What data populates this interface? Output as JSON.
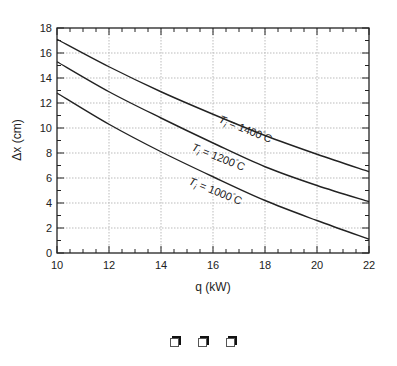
{
  "chart_data": {
    "type": "line",
    "title": "",
    "xlabel": "q (kW)",
    "ylabel": "Δx (cm)",
    "xlim": [
      10,
      22
    ],
    "ylim": [
      0,
      18
    ],
    "xticks": [
      10,
      12,
      14,
      16,
      18,
      20,
      22
    ],
    "yticks": [
      0,
      2,
      4,
      6,
      8,
      10,
      12,
      14,
      16,
      18
    ],
    "grid": true,
    "legend": "inline curve labels",
    "x": [
      10,
      12,
      14,
      16,
      18,
      20,
      22
    ],
    "series": [
      {
        "name": "Ti = 1400°C",
        "label_main": "T",
        "label_sub": "i",
        "label_rest": " = 1400",
        "label_unit": "C",
        "values": [
          17.1,
          14.9,
          12.9,
          11.1,
          9.4,
          7.9,
          6.5
        ]
      },
      {
        "name": "Ti = 1200°C",
        "label_main": "T",
        "label_sub": "i",
        "label_rest": " = 1200",
        "label_unit": "C",
        "values": [
          15.3,
          12.9,
          10.8,
          8.8,
          6.9,
          5.4,
          4.1
        ]
      },
      {
        "name": "Ti = 1000°C",
        "label_main": "T",
        "label_sub": "i",
        "label_rest": " = 1000",
        "label_unit": "C",
        "values": [
          12.8,
          10.3,
          8.1,
          6.1,
          4.2,
          2.6,
          1.1
        ]
      }
    ]
  },
  "footer_icons": [
    "window-icon",
    "window-icon",
    "window-icon"
  ]
}
